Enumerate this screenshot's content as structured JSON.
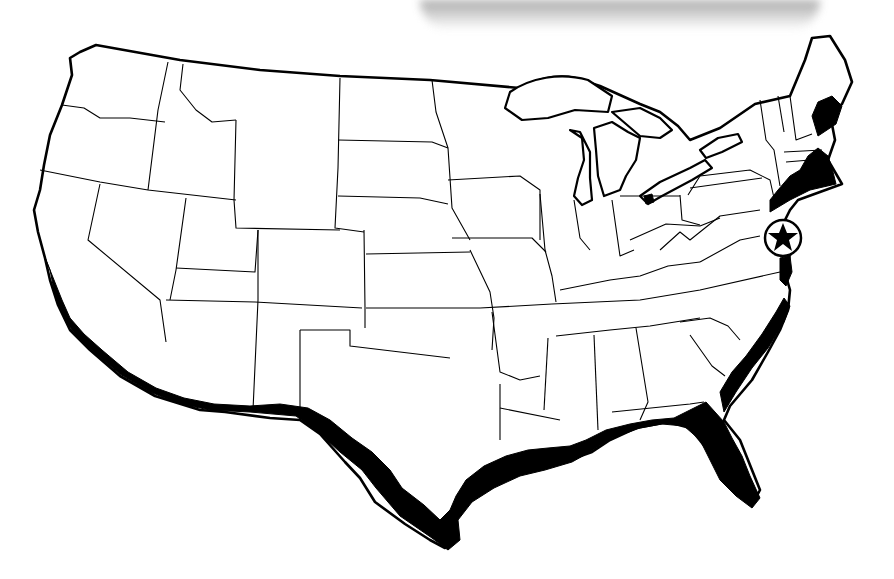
{
  "map": {
    "subject": "Contiguous United States outline map",
    "style": "black-and-white line drawing with state borders",
    "colors": {
      "background": "#ffffff",
      "land": "#ffffff",
      "outline": "#000000",
      "highlight_band": "#000000",
      "top_smudge": "#a0a0a0"
    },
    "highlighted_regions": [
      "Pacific coast (southern California)",
      "US-Mexico border (Arizona, New Mexico, Texas)",
      "Gulf of Mexico coast",
      "Florida coast",
      "Atlantic coast (Georgia, Carolinas)",
      "Northeast coast (New Jersey to Maine)"
    ],
    "marker": {
      "icon": "star-in-circle-icon",
      "location": "Washington, D.C. area",
      "glyph": "★"
    },
    "labels": []
  }
}
